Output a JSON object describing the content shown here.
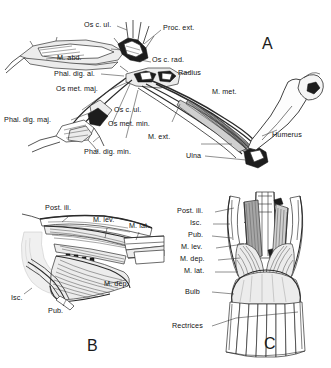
{
  "figure": {
    "kind": "anatomical-line-drawing",
    "panels": [
      {
        "id": "A",
        "letter": "A",
        "caption": "",
        "labels": [
          {
            "key": "os_c_ul_top",
            "text": "Os c. ul."
          },
          {
            "key": "proc_ext",
            "text": "Proc. ext."
          },
          {
            "key": "m_abd",
            "text": "M. abd."
          },
          {
            "key": "os_c_rad",
            "text": "Os c. rad."
          },
          {
            "key": "phal_dig_al",
            "text": "Phal. dig. al."
          },
          {
            "key": "radius",
            "text": "Radius"
          },
          {
            "key": "os_met_maj",
            "text": "Os met. maj."
          },
          {
            "key": "m_met",
            "text": "M. met."
          },
          {
            "key": "os_c_ul_mid",
            "text": "Os c. ul."
          },
          {
            "key": "phal_dig_maj",
            "text": "Phal. dig. maj."
          },
          {
            "key": "os_met_min",
            "text": "Os met. min."
          },
          {
            "key": "m_ext",
            "text": "M. ext."
          },
          {
            "key": "humerus",
            "text": "Humerus"
          },
          {
            "key": "phal_dig_min",
            "text": "Phal. dig. min."
          },
          {
            "key": "ulna",
            "text": "Ulna"
          }
        ]
      },
      {
        "id": "B",
        "letter": "B",
        "caption": "",
        "labels": [
          {
            "key": "post_ili",
            "text": "Post. ili."
          },
          {
            "key": "m_lev",
            "text": "M. lev."
          },
          {
            "key": "m_lat",
            "text": "M. lat."
          },
          {
            "key": "m_dep",
            "text": "M. dep."
          },
          {
            "key": "isc",
            "text": "Isc."
          },
          {
            "key": "pub",
            "text": "Pub."
          }
        ]
      },
      {
        "id": "C",
        "letter": "C",
        "caption": "",
        "labels": [
          {
            "key": "post_ili",
            "text": "Post. ili."
          },
          {
            "key": "isc",
            "text": "Isc."
          },
          {
            "key": "pub",
            "text": "Pub."
          },
          {
            "key": "m_lev",
            "text": "M. lev."
          },
          {
            "key": "m_dep",
            "text": "M. dep."
          },
          {
            "key": "m_lat",
            "text": "M. lat."
          },
          {
            "key": "bulb",
            "text": "Bulb"
          },
          {
            "key": "rectrices",
            "text": "Rectrices"
          }
        ]
      }
    ],
    "colors": {
      "background": "#ffffff",
      "ink": "#1a1a1a",
      "leader": "#333333",
      "muscle_light": "#ececec",
      "muscle_mid": "#cfcfcf",
      "muscle_dark": "#a6a6a6"
    }
  }
}
